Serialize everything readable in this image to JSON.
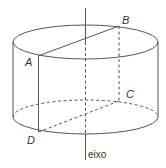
{
  "figure": {
    "type": "cylinder-section",
    "stroke_color": "#555555",
    "points": {
      "A": {
        "label": "A",
        "x": 38,
        "y": 56
      },
      "B": {
        "label": "B",
        "x": 119,
        "y": 26
      },
      "C": {
        "label": "C",
        "x": 120,
        "y": 100
      },
      "D": {
        "label": "D",
        "x": 39,
        "y": 131
      }
    },
    "axis": {
      "label": "eixo"
    }
  }
}
